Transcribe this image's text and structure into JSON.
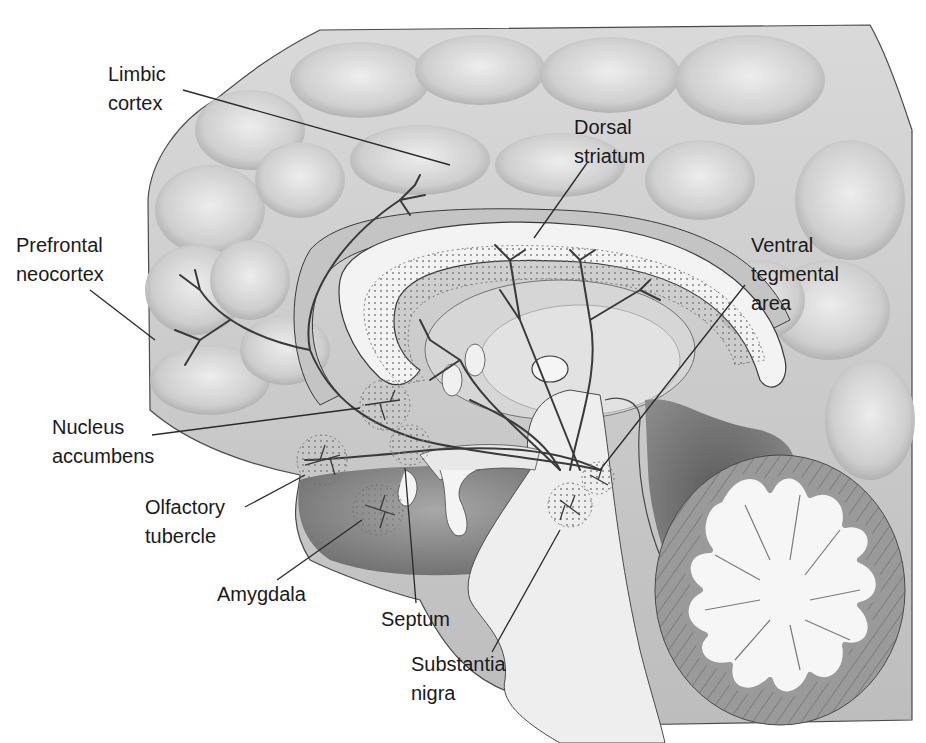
{
  "diagram": {
    "type": "anatomical-illustration",
    "colors": {
      "background": "#ffffff",
      "cortex_fill": "#d4d4d4",
      "cortex_shade": "#a9a9a9",
      "white_matter": "#efefef",
      "deep_shadow": "#6e6e6e",
      "line": "#2a2a2a",
      "label_text": "#1a1a1a"
    }
  },
  "labels": [
    {
      "id": "limbic-cortex",
      "lines": [
        "Limbic",
        "cortex"
      ],
      "x": 108,
      "y": 60,
      "leader": {
        "x1": 183,
        "y1": 90,
        "x2": 450,
        "y2": 165
      }
    },
    {
      "id": "dorsal-striatum",
      "lines": [
        "Dorsal",
        "striatum"
      ],
      "x": 574,
      "y": 113,
      "leader": {
        "x1": 587,
        "y1": 163,
        "x2": 534,
        "y2": 238
      }
    },
    {
      "id": "prefrontal-neocortex",
      "lines": [
        "Prefrontal",
        "neocortex"
      ],
      "x": 16,
      "y": 231,
      "leader": {
        "x1": 90,
        "y1": 290,
        "x2": 155,
        "y2": 340
      }
    },
    {
      "id": "ventral-tegmental-area",
      "lines": [
        "Ventral",
        "tegmental",
        "area"
      ],
      "x": 751,
      "y": 231,
      "leader": {
        "x1": 745,
        "y1": 285,
        "x2": 600,
        "y2": 470
      }
    },
    {
      "id": "nucleus-accumbens",
      "lines": [
        "Nucleus",
        "accumbens"
      ],
      "x": 52,
      "y": 413,
      "leader": {
        "x1": 152,
        "y1": 435,
        "x2": 360,
        "y2": 408
      }
    },
    {
      "id": "olfactory-tubercle",
      "lines": [
        "Olfactory",
        "tubercle"
      ],
      "x": 145,
      "y": 493,
      "leader": {
        "x1": 245,
        "y1": 507,
        "x2": 305,
        "y2": 475
      }
    },
    {
      "id": "amygdala",
      "lines": [
        "Amygdala"
      ],
      "x": 217,
      "y": 580,
      "leader": {
        "x1": 277,
        "y1": 580,
        "x2": 362,
        "y2": 520
      }
    },
    {
      "id": "septum",
      "lines": [
        "Septum"
      ],
      "x": 381,
      "y": 605,
      "leader": {
        "x1": 416,
        "y1": 603,
        "x2": 405,
        "y2": 468
      }
    },
    {
      "id": "substantia-nigra",
      "lines": [
        "Substantia",
        "nigra"
      ],
      "x": 411,
      "y": 650,
      "leader": {
        "x1": 492,
        "y1": 652,
        "x2": 560,
        "y2": 530
      }
    }
  ]
}
